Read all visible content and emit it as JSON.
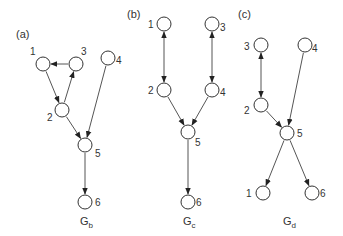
{
  "graphs": [
    {
      "panel_label": "(a)",
      "caption_main": "G",
      "caption_sub": "b",
      "nodes": [
        {
          "id": "1",
          "x": 43,
          "y": 64,
          "lx": 30,
          "ly": 55
        },
        {
          "id": "3",
          "x": 76,
          "y": 64,
          "lx": 81,
          "ly": 55
        },
        {
          "id": "4",
          "x": 108,
          "y": 58,
          "lx": 116,
          "ly": 64
        },
        {
          "id": "2",
          "x": 62,
          "y": 110,
          "lx": 47,
          "ly": 121
        },
        {
          "id": "5",
          "x": 85,
          "y": 145,
          "lx": 95,
          "ly": 157
        },
        {
          "id": "6",
          "x": 85,
          "y": 202,
          "lx": 95,
          "ly": 206
        }
      ],
      "edges": [
        {
          "from": "3",
          "to": "1",
          "type": "directed"
        },
        {
          "from": "1",
          "to": "2",
          "type": "directed"
        },
        {
          "from": "2",
          "to": "3",
          "type": "directed"
        },
        {
          "from": "2",
          "to": "5",
          "type": "directed"
        },
        {
          "from": "4",
          "to": "5",
          "type": "directed"
        },
        {
          "from": "5",
          "to": "6",
          "type": "directed"
        }
      ],
      "caption_x": 80,
      "caption_y": 225,
      "panel_x": 16,
      "panel_y": 38
    },
    {
      "panel_label": "(b)",
      "caption_main": "G",
      "caption_sub": "c",
      "nodes": [
        {
          "id": "1",
          "x": 164,
          "y": 24,
          "lx": 148,
          "ly": 28
        },
        {
          "id": "3",
          "x": 212,
          "y": 24,
          "lx": 220,
          "ly": 31
        },
        {
          "id": "2",
          "x": 164,
          "y": 90,
          "lx": 148,
          "ly": 94
        },
        {
          "id": "4",
          "x": 212,
          "y": 90,
          "lx": 220,
          "ly": 96
        },
        {
          "id": "5",
          "x": 188,
          "y": 132,
          "lx": 195,
          "ly": 146
        },
        {
          "id": "6",
          "x": 188,
          "y": 202,
          "lx": 196,
          "ly": 206
        }
      ],
      "edges": [
        {
          "from": "1",
          "to": "2",
          "type": "bidirected"
        },
        {
          "from": "3",
          "to": "4",
          "type": "bidirected"
        },
        {
          "from": "2",
          "to": "5",
          "type": "directed"
        },
        {
          "from": "4",
          "to": "5",
          "type": "directed"
        },
        {
          "from": "5",
          "to": "6",
          "type": "directed"
        }
      ],
      "caption_x": 183,
      "caption_y": 225,
      "panel_x": 127,
      "panel_y": 18
    },
    {
      "panel_label": "(c)",
      "caption_main": "G",
      "caption_sub": "d",
      "nodes": [
        {
          "id": "3",
          "x": 261,
          "y": 45,
          "lx": 244,
          "ly": 50
        },
        {
          "id": "4",
          "x": 305,
          "y": 45,
          "lx": 312,
          "ly": 52
        },
        {
          "id": "2",
          "x": 261,
          "y": 105,
          "lx": 244,
          "ly": 114
        },
        {
          "id": "5",
          "x": 287,
          "y": 133,
          "lx": 297,
          "ly": 137
        },
        {
          "id": "1",
          "x": 263,
          "y": 193,
          "lx": 246,
          "ly": 197
        },
        {
          "id": "6",
          "x": 312,
          "y": 193,
          "lx": 320,
          "ly": 197
        }
      ],
      "edges": [
        {
          "from": "3",
          "to": "2",
          "type": "bidirected"
        },
        {
          "from": "2",
          "to": "5",
          "type": "directed"
        },
        {
          "from": "4",
          "to": "5",
          "type": "directed"
        },
        {
          "from": "5",
          "to": "1",
          "type": "directed"
        },
        {
          "from": "5",
          "to": "6",
          "type": "directed"
        }
      ],
      "caption_x": 283,
      "caption_y": 225,
      "panel_x": 238,
      "panel_y": 18
    }
  ],
  "style": {
    "node_radius": 7,
    "stroke_color": "#333333",
    "edge_color": "#555555",
    "background": "#ffffff"
  }
}
